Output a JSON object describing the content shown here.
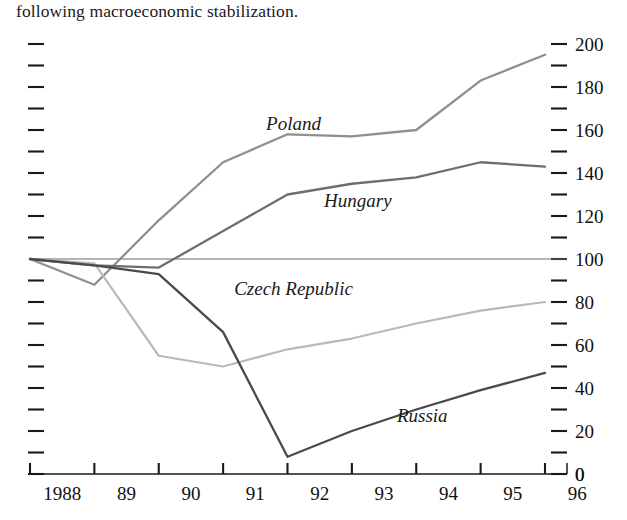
{
  "caption": {
    "text": "following macroeconomic stabilization."
  },
  "chart_data": {
    "type": "line",
    "title": "",
    "subtitle": "",
    "xlabel": "",
    "ylabel": "",
    "x": [
      "1988",
      "89",
      "90",
      "91",
      "92",
      "93",
      "94",
      "95",
      "96"
    ],
    "xtick_labels": [
      "1988",
      "89",
      "90",
      "91",
      "92",
      "93",
      "94",
      "95",
      "96"
    ],
    "ytick_labels": [
      "0",
      "20",
      "40",
      "60",
      "80",
      "100",
      "120",
      "140",
      "160",
      "180",
      "200"
    ],
    "ytick_values": [
      0,
      20,
      40,
      60,
      80,
      100,
      120,
      140,
      160,
      180,
      200
    ],
    "yminor_step": 10,
    "ylim": [
      0,
      200
    ],
    "grid": false,
    "reference_line": 100,
    "legend_position": "inline-labels",
    "axis_labels_side": "right",
    "series": [
      {
        "name": "Poland",
        "color": "#8f8f8f",
        "label_x": "92",
        "label_y": 163,
        "values": [
          100,
          88,
          118,
          145,
          158,
          157,
          160,
          183,
          195
        ]
      },
      {
        "name": "Hungary",
        "color": "#6e6e6e",
        "label_x": "93",
        "label_y": 127,
        "values": [
          100,
          97,
          96,
          113,
          130,
          135,
          138,
          145,
          143
        ]
      },
      {
        "name": "Czech Republic",
        "color": "#b9b9b9",
        "label_x": "92",
        "label_y": 86,
        "values": [
          100,
          98,
          55,
          50,
          58,
          63,
          70,
          76,
          80
        ]
      },
      {
        "name": "Russia",
        "color": "#4a4a4a",
        "label_x": "94",
        "label_y": 27,
        "values": [
          100,
          97,
          93,
          66,
          8,
          20,
          30,
          39,
          47
        ]
      }
    ]
  }
}
